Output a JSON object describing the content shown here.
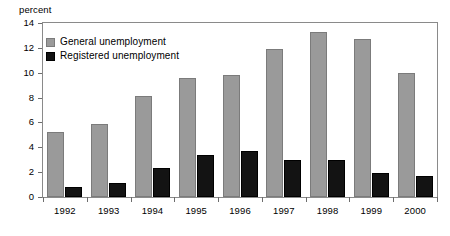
{
  "chart_data": {
    "type": "bar",
    "title": "",
    "subtitle": "",
    "xlabel": "",
    "ylabel": "percent",
    "ylim": [
      0,
      14
    ],
    "yticks": [
      0,
      2,
      4,
      6,
      8,
      10,
      12,
      14
    ],
    "grid": false,
    "legend_position": "top-left-inside",
    "categories": [
      "1992",
      "1993",
      "1994",
      "1995",
      "1996",
      "1997",
      "1998",
      "1999",
      "2000"
    ],
    "series": [
      {
        "name": "General unemployment",
        "color": "#9a9a9a",
        "values": [
          5.2,
          5.9,
          8.1,
          9.6,
          9.8,
          11.9,
          13.3,
          12.7,
          10.0
        ]
      },
      {
        "name": "Registered unemployment",
        "color": "#131313",
        "values": [
          0.8,
          1.1,
          2.3,
          3.4,
          3.7,
          3.0,
          3.0,
          1.9,
          1.7
        ]
      }
    ]
  },
  "axis": {
    "y_caption": "percent"
  },
  "legend": {
    "items": [
      {
        "label": "General unemployment",
        "swatch": "general"
      },
      {
        "label": "Registered unemployment",
        "swatch": "registered"
      }
    ]
  }
}
